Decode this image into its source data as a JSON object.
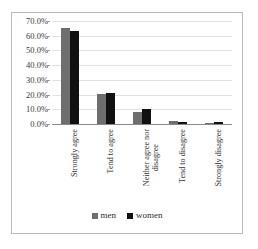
{
  "chart_data": {
    "type": "bar",
    "title": "",
    "subtitle": "",
    "xlabel": "",
    "ylabel": "",
    "ylim": [
      0,
      70
    ],
    "ytick_labels": [
      "70.0%",
      "60.0%",
      "50.0%",
      "40.0%",
      "30.0%",
      "20.0%",
      "10.0%",
      "0.0%"
    ],
    "ytick_values": [
      70,
      60,
      50,
      40,
      30,
      20,
      10,
      0
    ],
    "grid": true,
    "legend_position": "bottom",
    "categories": [
      "Strongly agree",
      "Tend to agree",
      "Neither agree nor disagree",
      "Tend to disagree",
      "Strongly disagree"
    ],
    "category_lines": [
      [
        "Strongly agree"
      ],
      [
        "Tend to agree"
      ],
      [
        "Neither agree nor",
        "disagree"
      ],
      [
        "Tend to disagree"
      ],
      [
        "Strongly disagree"
      ]
    ],
    "series": [
      {
        "name": "men",
        "color": "#6e6e6e",
        "values": [
          65.5,
          20.5,
          8.5,
          2.0,
          1.0
        ]
      },
      {
        "name": "women",
        "color": "#111111",
        "values": [
          63.5,
          21.0,
          10.5,
          1.7,
          1.3
        ]
      }
    ]
  },
  "legend": {
    "items": [
      {
        "label": "men"
      },
      {
        "label": "women"
      }
    ]
  }
}
